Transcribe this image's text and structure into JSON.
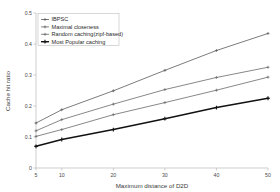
{
  "chart_data": {
    "type": "line",
    "title": "",
    "xlabel": "Maximum distance of D2D",
    "ylabel": "Cache hit ratio",
    "x": [
      5,
      10,
      20,
      30,
      40,
      50
    ],
    "xlim": [
      5,
      50
    ],
    "ylim": [
      0,
      0.5
    ],
    "xticks": [
      "5",
      "10",
      "20",
      "30",
      "40",
      "50"
    ],
    "yticks": [
      "0",
      "0.1",
      "0.2",
      "0.3",
      "0.4",
      "0.5"
    ],
    "grid": false,
    "legend_position": "upper left",
    "series": [
      {
        "name": "IBPSC",
        "values": [
          0.145,
          0.188,
          0.249,
          0.315,
          0.379,
          0.434
        ],
        "color": "#5a5a5a",
        "marker": "plus",
        "width": 0.8
      },
      {
        "name": "Maximal closeness",
        "values": [
          0.12,
          0.156,
          0.206,
          0.253,
          0.292,
          0.325
        ],
        "color": "#6a6a6a",
        "marker": "plus",
        "width": 0.8
      },
      {
        "name": "Random caching(zipf-based)",
        "values": [
          0.102,
          0.124,
          0.172,
          0.211,
          0.251,
          0.293
        ],
        "color": "#6a6a6a",
        "marker": "plus",
        "width": 0.8
      },
      {
        "name": "Most Popular caching",
        "values": [
          0.07,
          0.092,
          0.124,
          0.159,
          0.195,
          0.225
        ],
        "color": "#111111",
        "marker": "plus",
        "width": 1.5
      }
    ]
  },
  "axes": {
    "x_title": "Maximum distance of D2D",
    "y_title": "Cache hit ratio"
  }
}
